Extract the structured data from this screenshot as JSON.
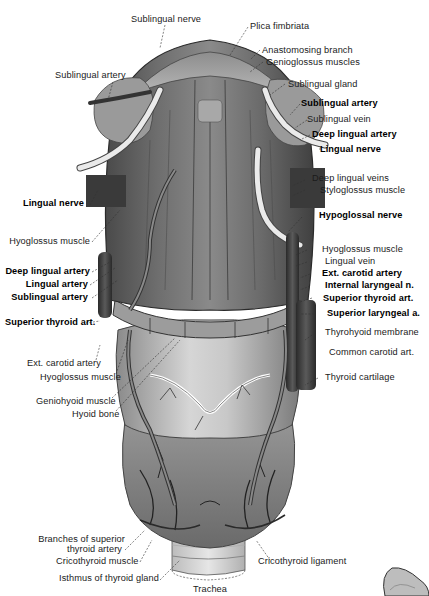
{
  "figure": {
    "labels": {
      "sublingual_nerve": "Sublingual nerve",
      "plica_fimbriata": "Plica fimbriata",
      "anastomosing_branch": "Anastomosing branch",
      "genioglossus_muscles": "Genioglossus muscles",
      "sublingual_artery_top_left": "Sublingual artery",
      "sublingual_gland": "Sublingual gland",
      "sublingual_artery_right": "Sublingual artery",
      "sublingual_vein": "Sublingual vein",
      "deep_lingual_artery_right": "Deep lingual artery",
      "lingual_nerve_right": "Lingual nerve",
      "deep_lingual_veins": "Deep lingual veins",
      "styloglossus_muscle": "Styloglossus muscle",
      "lingual_nerve_left": "Lingual nerve",
      "hypoglossal_nerve": "Hypoglossal nerve",
      "hyoglossus_muscle_left": "Hyoglossus muscle",
      "hyoglossus_muscle_right": "Hyoglossus muscle",
      "lingual_vein": "Lingual vein",
      "deep_lingual_artery_left": "Deep lingual artery",
      "ext_carotid_artery_right": "Ext. carotid artery",
      "lingual_artery": "Lingual artery",
      "internal_laryngeal_n": "Internal laryngeal n.",
      "sublingual_artery_left": "Sublingual artery",
      "superior_thyroid_art_right": "Superior thyroid art.",
      "superior_thyroid_art_left": "Superior thyroid art.",
      "superior_laryngeal_a": "Superior laryngeal a.",
      "thyrohyoid_membrane": "Thyrohyoid membrane",
      "ext_carotid_artery_left": "Ext. carotid artery",
      "common_carotid_art": "Common carotid art.",
      "hyoglossus_muscle_lower": "Hyoglossus muscle",
      "thyroid_cartilage": "Thyroid cartilage",
      "geniohyoid_muscle": "Geniohyoid muscle",
      "hyoid_bone": "Hyoid bone",
      "branches_superior_thyroid_1": "Branches of superior",
      "branches_superior_thyroid_2": "thyroid artery",
      "cricothyroid_muscle": "Cricothyroid muscle",
      "cricothyroid_ligament": "Cricothyroid ligament",
      "isthmus_thyroid_gland": "Isthmus of thyroid gland",
      "trachea": "Trachea"
    },
    "colors": {
      "ink": "#1a1a1a",
      "tissue_dark": "#3a3a3a",
      "tissue_mid": "#7a7a7a",
      "tissue_light": "#bdbdbd",
      "background": "#ffffff"
    }
  }
}
